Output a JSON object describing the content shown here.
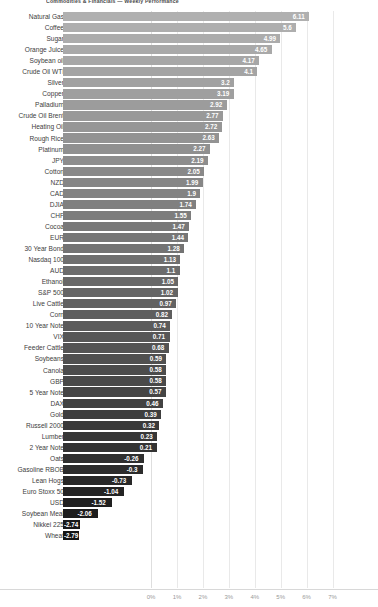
{
  "chart_data": {
    "type": "bar",
    "orientation": "horizontal",
    "title": "Commodities & Financials — Weekly Performance",
    "xlabel": "",
    "ylabel": "",
    "xlim": [
      -3.4,
      8.6
    ],
    "grid": true,
    "legend": false,
    "value_suffix": "",
    "tick_labels": [
      "0%",
      "1%",
      "2%",
      "3%",
      "4%",
      "5%",
      "6%",
      "7%"
    ],
    "tick_values": [
      0,
      1,
      2,
      3,
      4,
      5,
      6,
      7
    ],
    "categories": [
      "Natural Gas",
      "Coffee",
      "Sugar",
      "Orange Juice",
      "Soybean oil",
      "Crude Oil WTI",
      "Silver",
      "Copper",
      "Palladium",
      "Crude Oil Brent",
      "Heating Oil",
      "Rough Rice",
      "Platinum",
      "JPY",
      "Cotton",
      "NZD",
      "CAD",
      "DJIA",
      "CHF",
      "Cocoa",
      "EUR",
      "30 Year Bond",
      "Nasdaq 100",
      "AUD",
      "Ethanol",
      "S&P 500",
      "Live Cattle",
      "Corn",
      "10 Year Note",
      "VIX",
      "Feeder Cattle",
      "Soybeans",
      "Canola",
      "GBP",
      "5 Year Note",
      "DAX",
      "Gold",
      "Russell 2000",
      "Lumber",
      "2 Year Note",
      "Oats",
      "Gasoline RBOB",
      "Lean Hogs",
      "Euro Stoxx 50",
      "USD",
      "Soybean Meal",
      "Nikkei 225",
      "Wheat"
    ],
    "values": [
      6.11,
      5.6,
      4.99,
      4.65,
      4.17,
      4.1,
      3.2,
      3.19,
      2.92,
      2.77,
      2.72,
      2.63,
      2.27,
      2.19,
      2.05,
      1.99,
      1.9,
      1.74,
      1.55,
      1.47,
      1.44,
      1.28,
      1.13,
      1.1,
      1.05,
      1.02,
      0.97,
      0.82,
      0.74,
      0.71,
      0.68,
      0.59,
      0.58,
      0.58,
      0.57,
      0.46,
      0.39,
      0.32,
      0.23,
      0.21,
      -0.26,
      -0.3,
      -0.73,
      -1.04,
      -1.52,
      -2.06,
      -2.74,
      -2.79
    ],
    "value_labels": [
      "6.11",
      "5.6",
      "4.99",
      "4.65",
      "4.17",
      "4.1",
      "3.2",
      "3.19",
      "2.92",
      "2.77",
      "2.72",
      "2.63",
      "2.27",
      "2.19",
      "2.05",
      "1.99",
      "1.9",
      "1.74",
      "1.55",
      "1.47",
      "1.44",
      "1.28",
      "1.13",
      "1.1",
      "1.05",
      "1.02",
      "0.97",
      "0.82",
      "0.74",
      "0.71",
      "0.68",
      "0.59",
      "0.58",
      "0.58",
      "0.57",
      "0.46",
      "0.39",
      "0.32",
      "0.23",
      "0.21",
      "-0.26",
      "-0.3",
      "-0.73",
      "-1.04",
      "-1.52",
      "-2.06",
      "-2.74",
      "-2.79"
    ]
  },
  "colors": {
    "bar_high": "#b0b0b0",
    "bar_low": "#151515",
    "label_light": "#ffffff",
    "label_dark": "#333333",
    "grid": "#e9e9e9",
    "axis_text": "#9a9a9a",
    "category_text": "#3d3d3d",
    "background": "#ffffff"
  }
}
